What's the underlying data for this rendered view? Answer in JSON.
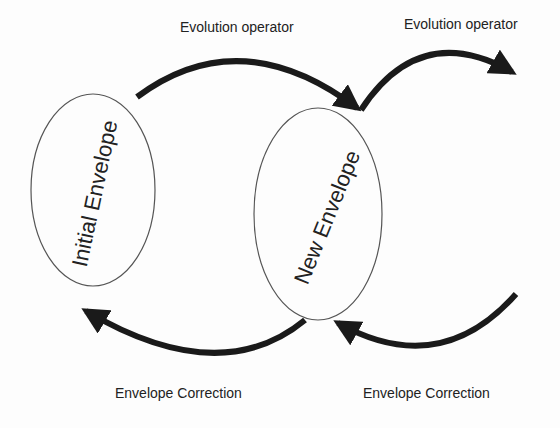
{
  "diagram": {
    "nodes": [
      {
        "id": "initial",
        "label": "Initial Envelope"
      },
      {
        "id": "new",
        "label": "New Envelope"
      }
    ],
    "edges": [
      {
        "from": "initial",
        "to": "new",
        "label": "Evolution operator"
      },
      {
        "from": "new",
        "to": "next",
        "label": "Evolution operator"
      },
      {
        "from": "new",
        "to": "initial",
        "label": "Envelope Correction"
      },
      {
        "from": "next",
        "to": "new",
        "label": "Envelope Correction"
      }
    ]
  },
  "colors": {
    "stroke": "#1a1a1a",
    "ellipse": "#555555",
    "background": "#fdfdfd"
  }
}
